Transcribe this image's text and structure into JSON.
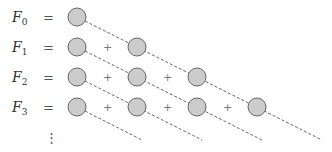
{
  "diagram": {
    "rows": [
      {
        "label": "F",
        "subscript": "0",
        "equals": "=",
        "count": 1
      },
      {
        "label": "F",
        "subscript": "1",
        "equals": "=",
        "count": 2
      },
      {
        "label": "F",
        "subscript": "2",
        "equals": "=",
        "count": 3
      },
      {
        "label": "F",
        "subscript": "3",
        "equals": "=",
        "count": 4
      }
    ],
    "operator": "+",
    "continuation": "⋮",
    "colors": {
      "circle_fill": "#cccccc",
      "circle_stroke": "#666666",
      "dash": "#666666"
    }
  }
}
